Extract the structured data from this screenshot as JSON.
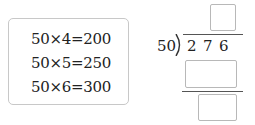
{
  "hint": {
    "lines": [
      "50×4=200",
      "50×5=250",
      "50×6=300"
    ]
  },
  "division": {
    "divisor": "50",
    "dividend_digits": [
      "2",
      "7",
      "6"
    ],
    "quotient_blank": "",
    "product_blank": "",
    "remainder_blank": ""
  }
}
